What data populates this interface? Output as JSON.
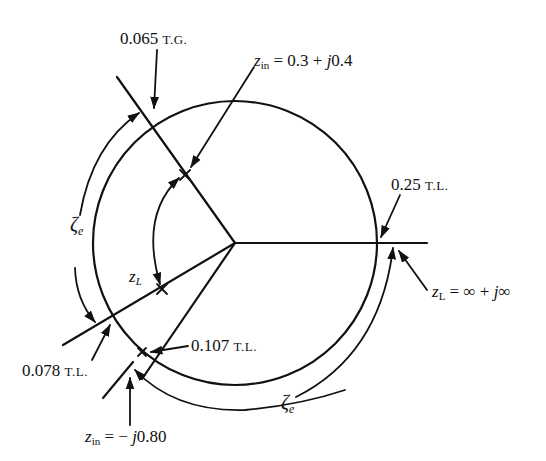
{
  "figure": {
    "type": "smith-chart-construction",
    "labels": {
      "tg_065": {
        "value": "0.065",
        "unit": "T.G."
      },
      "tl_025": {
        "value": "0.25",
        "unit": "T.L."
      },
      "tl_078": {
        "value": "0.078",
        "unit": "T.L."
      },
      "tl_107": {
        "value": "0.107",
        "unit": "T.L."
      },
      "zin_top": {
        "var": "z",
        "sub": "in",
        "expr": "= 0.3 + ",
        "j": "j",
        "imag": "0.4"
      },
      "zin_bottom": {
        "var": "z",
        "sub": "in",
        "expr": "= − ",
        "j": "j",
        "imag": "0.80"
      },
      "zl_inf": {
        "var": "z",
        "sub": "L",
        "expr": "= ∞ + ",
        "j": "j",
        "imag": "∞"
      },
      "zl_point": {
        "var": "z",
        "sub": "L"
      },
      "zeta_left": {
        "symbol": "ζ",
        "sub": "e"
      },
      "zeta_bottom": {
        "symbol": "ζ",
        "sub": "e"
      }
    },
    "geometry": {
      "center": [
        235,
        243
      ],
      "radius": 142,
      "stroke_color": "#111111"
    }
  }
}
